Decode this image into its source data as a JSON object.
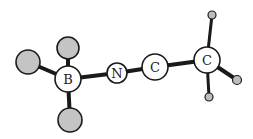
{
  "diagram": {
    "type": "molecule-ball-and-stick",
    "atoms": [
      {
        "id": "x1",
        "label": "",
        "kind": "substituent",
        "cx": 28,
        "cy": 62,
        "r": 12
      },
      {
        "id": "x2",
        "label": "",
        "kind": "substituent",
        "cx": 68,
        "cy": 48,
        "r": 11
      },
      {
        "id": "x3",
        "label": "",
        "kind": "substituent",
        "cx": 70,
        "cy": 120,
        "r": 12
      },
      {
        "id": "b",
        "label": "B",
        "kind": "labeled",
        "cx": 68,
        "cy": 79,
        "r": 13
      },
      {
        "id": "n",
        "label": "N",
        "kind": "labeled",
        "cx": 117,
        "cy": 73,
        "r": 10
      },
      {
        "id": "c1",
        "label": "C",
        "kind": "labeled",
        "cx": 155,
        "cy": 67,
        "r": 13
      },
      {
        "id": "c2",
        "label": "C",
        "kind": "labeled",
        "cx": 207,
        "cy": 60,
        "r": 13
      },
      {
        "id": "h1",
        "label": "",
        "kind": "hydrogen",
        "cx": 212,
        "cy": 15,
        "r": 4
      },
      {
        "id": "h2",
        "label": "",
        "kind": "hydrogen",
        "cx": 237,
        "cy": 80,
        "r": 4
      },
      {
        "id": "h3",
        "label": "",
        "kind": "hydrogen",
        "cx": 209,
        "cy": 97,
        "r": 4
      }
    ],
    "labels": {
      "b": "B",
      "n": "N",
      "c1": "C",
      "c2": "C"
    },
    "colors": {
      "bond": "#1a1a1a",
      "outline": "#1a1a1a",
      "labeled_fill": "#ffffff",
      "substituent_fill": "#c4c4c4",
      "hydrogen_fill": "#bdbdbd"
    }
  }
}
